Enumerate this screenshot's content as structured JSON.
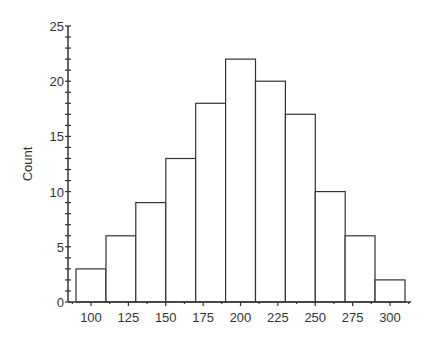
{
  "chart_data": {
    "type": "bar",
    "subtype": "histogram",
    "title": "",
    "xlabel": "",
    "ylabel": "Count",
    "bin_width": 20,
    "bins": [
      {
        "start": 90,
        "end": 110,
        "count": 3
      },
      {
        "start": 110,
        "end": 130,
        "count": 6
      },
      {
        "start": 130,
        "end": 150,
        "count": 9
      },
      {
        "start": 150,
        "end": 170,
        "count": 13
      },
      {
        "start": 170,
        "end": 190,
        "count": 18
      },
      {
        "start": 190,
        "end": 210,
        "count": 22
      },
      {
        "start": 210,
        "end": 230,
        "count": 20
      },
      {
        "start": 230,
        "end": 250,
        "count": 17
      },
      {
        "start": 250,
        "end": 270,
        "count": 10
      },
      {
        "start": 270,
        "end": 290,
        "count": 6
      },
      {
        "start": 290,
        "end": 310,
        "count": 2
      }
    ],
    "categories": [
      "90-110",
      "110-130",
      "130-150",
      "150-170",
      "170-190",
      "190-210",
      "210-230",
      "230-250",
      "250-270",
      "270-290",
      "290-310"
    ],
    "values": [
      3,
      6,
      9,
      13,
      18,
      22,
      20,
      17,
      10,
      6,
      2
    ],
    "x_ticks": [
      100,
      125,
      150,
      175,
      200,
      225,
      250,
      275,
      300
    ],
    "y_ticks": [
      0,
      5,
      10,
      15,
      20,
      25
    ],
    "xlim": [
      86,
      312
    ],
    "ylim": [
      0,
      25
    ],
    "grid": false,
    "legend": null,
    "bar_fill": "#ffffff",
    "bar_stroke": "#333333",
    "axis_color": "#333333"
  }
}
